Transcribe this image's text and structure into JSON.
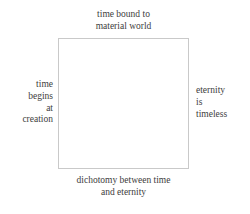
{
  "diagram": {
    "title": "dichotomy between time and eternity",
    "type": "labeled-square",
    "background_color": "#ffffff",
    "text_color": "#3d3d3d",
    "box": {
      "border_color": "#c9c9c9",
      "fill_color": "#ffffff",
      "border_width_px": 1,
      "content": ""
    },
    "labels": {
      "top": "time bound to\nmaterial world",
      "left": "time\nbegins\nat\ncreation",
      "right": "eternity\nis\ntimeless",
      "bottom": "dichotomy between time\nand eternity"
    }
  }
}
